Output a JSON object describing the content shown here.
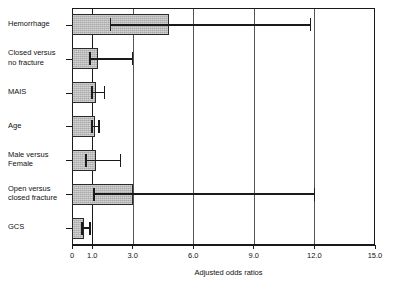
{
  "chart_data": {
    "type": "bar",
    "orientation": "horizontal",
    "title": "",
    "xlabel": "Adjusted odds ratios",
    "ylabel": "",
    "xlim": [
      0,
      15.0
    ],
    "xticks": [
      0,
      1.0,
      3.0,
      6.0,
      9.0,
      12.0,
      15.0
    ],
    "xtick_labels": [
      "0",
      "1.0",
      "3.0",
      "6.0",
      "9.0",
      "12.0",
      "15.0"
    ],
    "gridlines": [
      1.0,
      3.0,
      6.0,
      9.0,
      12.0
    ],
    "grid": true,
    "legend": "none",
    "reference_line": 1.0,
    "categories": [
      "Hemorrhage",
      "Closed versus\nno fracture",
      "MAIS",
      "Age",
      "Male versus\nFemale",
      "Open versus\nclosed fracture",
      "GCS"
    ],
    "values": [
      4.8,
      1.3,
      1.2,
      1.15,
      1.2,
      3.0,
      0.6
    ],
    "ci_low": [
      1.9,
      0.9,
      1.0,
      1.0,
      0.7,
      1.1,
      0.5
    ],
    "ci_high": [
      11.8,
      3.0,
      1.6,
      1.35,
      2.4,
      12.0,
      0.9
    ],
    "series": [
      {
        "name": "Adjusted odds ratio",
        "values": [
          4.8,
          1.3,
          1.2,
          1.15,
          1.2,
          3.0,
          0.6
        ]
      }
    ],
    "bar_color": "#a9a9a9",
    "bar_edge_color": "#2a2a2a",
    "error_color": "#1a1a1a",
    "axis_color": "#1a1a1a"
  },
  "axis": {
    "x_title": "Adjusted odds ratios"
  }
}
